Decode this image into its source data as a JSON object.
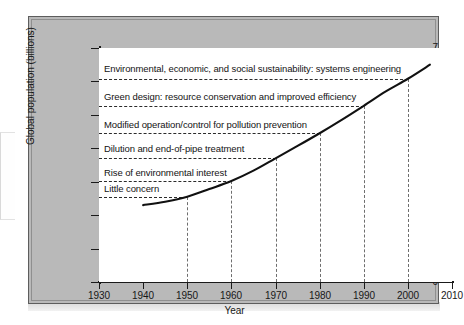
{
  "chart_data": {
    "type": "line",
    "title": "",
    "xlabel": "Year",
    "ylabel": "Global population (billions)",
    "xlim": [
      1930,
      2010
    ],
    "ylim": [
      0,
      7
    ],
    "xticks": [
      1930,
      1940,
      1950,
      1960,
      1970,
      1980,
      1990,
      2000,
      2010
    ],
    "yticks": [
      0,
      1,
      2,
      3,
      4,
      5,
      6,
      7
    ],
    "grid": "dashed-vertical-at-annotation-crossings",
    "legend": "none",
    "series": [
      {
        "name": "Global population",
        "x": [
          1940,
          1945,
          1950,
          1955,
          1960,
          1965,
          1970,
          1975,
          1980,
          1985,
          1990,
          1995,
          2000,
          2005
        ],
        "values": [
          2.3,
          2.4,
          2.55,
          2.78,
          3.02,
          3.33,
          3.7,
          4.07,
          4.45,
          4.85,
          5.27,
          5.7,
          6.08,
          6.5
        ]
      }
    ],
    "annotations": [
      {
        "label": "Environmental, economic, and social sustainability: systems engineering",
        "value": 6.08,
        "line_end_year": 2000
      },
      {
        "label": "Green design: resource conservation and improved efficiency",
        "value": 5.27,
        "line_end_year": 1990
      },
      {
        "label": "Modified operation/control for pollution prevention",
        "value": 4.45,
        "line_end_year": 1980
      },
      {
        "label": "Dilution and end-of-pipe treatment",
        "value": 3.7,
        "line_end_year": 1970
      },
      {
        "label": "Rise of environmental interest",
        "value": 3.02,
        "line_end_year": 1960
      },
      {
        "label": "Little concern",
        "value": 2.55,
        "line_end_year": 1950
      }
    ],
    "vertical_gridline_years": [
      1950,
      1960,
      1970,
      1980,
      1990,
      2000
    ],
    "colors": {
      "panel_background": "#b9b9b9",
      "plot_background": "#ffffff",
      "axis": "#1a1a1a",
      "curve": "#111111",
      "annotation_dash": "#2b2b2b",
      "gridline_dash": "#6e6e6e"
    }
  },
  "axes": {
    "y_tick_labels": [
      "7",
      "6",
      "5",
      "4",
      "3",
      "2",
      "1",
      "0"
    ],
    "x_tick_labels": [
      "1930",
      "1940",
      "1950",
      "1960",
      "1970",
      "1980",
      "1990",
      "2000",
      "2010"
    ],
    "y_title": "Global population (billions)",
    "x_title": "Year"
  },
  "annotation_labels": {
    "l1": "Environmental, economic, and social sustainability: systems engineering",
    "l2": "Green design: resource conservation and improved efficiency",
    "l3": "Modified operation/control for pollution prevention",
    "l4": "Dilution and end-of-pipe treatment",
    "l5": "Rise of environmental interest",
    "l6": "Little concern"
  }
}
